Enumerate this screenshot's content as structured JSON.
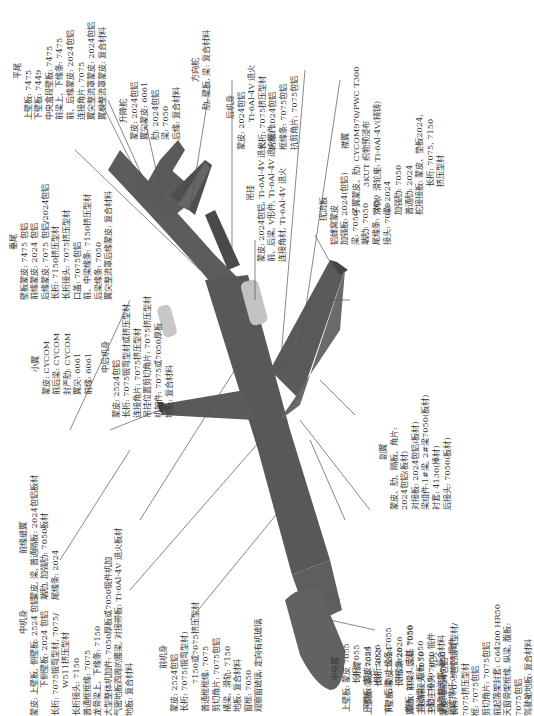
{
  "figure": {
    "orientation": "rotated-90-ccw",
    "parts": {
      "horizontal_tail": {
        "title": "平尾",
        "lines": [
          "上壁板: 7475",
          "下壁板: 7449",
          "中央盒段壁板: 7475",
          "前梁上、下缘条: 7475",
          "前、后缘蒙皮: 2024包铝",
          "连接角片: 7075",
          "翼尖整流罩蒙皮: 2024包铝",
          "翼根整流罩蒙皮: 复合材料"
        ]
      },
      "vertical_tail": {
        "title": "垂尾",
        "lines": [
          "壁板蒙皮: 7475 包铝",
          "前缘蒙皮: 2024 包铝",
          "后缘蒙皮: 7075 包铝/2024包铝",
          "长桁: 7150挤压型材",
          "长桁接头: 7075挤压型材",
          "口盖: 7075包铝",
          "前、中梁缘条: 7150挤压型材",
          "后梁缘条: 7050",
          "翼尖整流罩后缘蒙皮: 复合材料"
        ]
      },
      "elevator": {
        "title": "升降舵",
        "lines": [
          "蒙皮: 2024包铝",
          "翼尖蒙皮: 6061",
          "肋: 2024包铝",
          "梁: 7050",
          "后缘: 复合材料"
        ]
      },
      "rudder": {
        "title": "方向舵",
        "lines": [
          "肋, 壁板, 梁: 复合材料"
        ]
      },
      "aft_fuselage": {
        "title": "后机身",
        "lines": [
          "蒙皮: 2024包铝",
          "Ti-6Al-4V  退火",
          "长桁: 7075挤压型材",
          "桁框: 2024包铝",
          "框缘条: 7075包铝",
          "抗剪角片: 7075包铝"
        ]
      },
      "pylon": {
        "title": "吊挂",
        "lines": [
          "蒙皮: 2024包铝, Ti-6Al-4V  退火",
          "前、后梁, V形件, Ti-6Al-4V  退火锻件",
          "连接角材, Ti-6Al-4V 退火"
        ]
      },
      "flap": {
        "title": "襟翼",
        "lines": [
          "子翼蒙皮、肋: CYCOM970/PWC T300",
          "3KUT 织物预浸布",
          "滑轨、滑轮座: Ti-6Al-4V(精铸)",
          "梁: 2024",
          "加强肋: 7050",
          "普通肋: 2024",
          "舵接接板: 蒙皮、垫板2024,",
          "长桁: 7075, 7150",
          "挤压型材"
        ]
      },
      "spoiler": {
        "title": "扰流板",
        "lines": [
          "铝蜂窝蒙皮",
          "加强板: 2024(包铝)",
          "梁: 7050",
          "端肋: 7050",
          "尾缘条: 7050",
          "接头: 7050"
        ]
      },
      "winglet": {
        "title": "小翼",
        "lines": [
          "蒙皮: CYCOM",
          "前后梁: CYCOM",
          "封严肋: CYCOM",
          "翼尖: 6061",
          "前缘: 6061"
        ]
      },
      "mid_aft_fuselage": {
        "title": "中后机身",
        "lines": [
          "蒙皮: 2524包铝",
          "长桁: 7075锻弯型材或挤压型材",
          "连接角片: 7075挤压型材",
          "吊挂位置剪切角片: 7075挤压型材",
          "机加件: 7075或7050厚板",
          "地板: 复合材料"
        ]
      },
      "leading_edge_slat": {
        "title": "前缘缝翼",
        "lines": [
          "蒙皮, 梁, 普通隔板: 2024包铝板材",
          "端肋, 加强肋: 7050板材",
          "尾缘条: 2024"
        ]
      },
      "center_fuselage": {
        "title": "中机身",
        "lines": [
          "蒙皮: 上壁板, 侧壁板: 2524 包铝",
          "下侧壁板: 2024 包铝",
          "长桁: 7075锻弯型材, 7075/",
          "W511挤压型材",
          "长桁接头: 7150",
          "普通框框缘: 7075",
          "龙骨梁上、下缘条: 7150",
          "大型整体机加件: 7050厚板或7050锻件机加",
          "气密地板四周的腰梁, 对接带板: Ti-6Al-4V  退火板材",
          "地板: 复合材料"
        ]
      },
      "forward_fuselage": {
        "title": "前机身",
        "lines": [
          "蒙皮: 2524包铝",
          "长桁: 7075(锻弯型材)",
          "7150或7075挤压型材",
          "普通框框缘: 7075",
          "剪切角片: 7075包铝",
          "横梁、滑轨: 7150",
          "地板: 复合材料",
          "窗框: 7050",
          "观察窗玻璃: 定向有机玻璃"
        ]
      },
      "outer_wing": {
        "title": "外翼",
        "lines": [
          "上壁板: 蒙皮  7055",
          "长桁  7055",
          "下壁板: 蒙皮  2324",
          "长桁  2026",
          "翼肋、前梁、后梁: 7050",
          "主起前接头        7050",
          "主起主接头        7050  锻件",
          "主起辅助梁        7050",
          "固定撑杆            300M  锻件"
        ]
      },
      "inner_wing": {
        "title": "副翼",
        "lines": [
          "蒙皮、肋、隔板、角片:",
          "2024包铝(板材)",
          "对接板: 2024包铝(板材)",
          "梁组件:1#梁, 2#梁7050(板材)",
          "衬套: 4130(棒材)",
          "后接头: 7050(板材)"
        ]
      },
      "center_wing": {
        "title": "中央翼",
        "lines": [
          "上壁板: 蒙皮  7055",
          "长桁  7055",
          "下壁板: 蒙皮2324",
          "长桁  2026",
          "前、后梁: 上缘条  7055",
          "下缘条  2026",
          "腹板: 2024, 支柱  7050",
          "滑动梁、腹板  7050",
          "0肋: 7050",
          "翼身整流罩: 复合材料"
        ]
      },
      "nose": {
        "title": "机头",
        "lines": [
          "蒙皮: 2524包铝",
          "长桁: 7075包铝锻弯型材/",
          "7075挤压型材",
          "框: 7075包铝",
          "剪切角片: 7075包铝",
          "前起落架封套: C64200 HR50",
          "天窗骨架框缘, 纵梁, 腹板:",
          "7075包铝",
          "驾驶舱地板: 复合材料"
        ]
      }
    },
    "colors": {
      "airframe": "#5c5c5c",
      "airframe_dark": "#444444",
      "leader": "#555555",
      "nacelle": "#bdbdbd",
      "text": "#3a3a3a"
    }
  }
}
